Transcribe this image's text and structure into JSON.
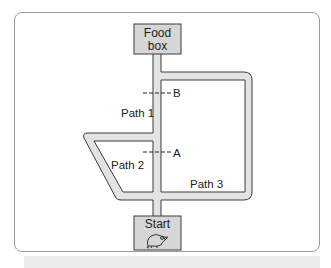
{
  "diagram": {
    "type": "rat maze with three paths",
    "boxes": {
      "food": {
        "line1": "Food",
        "line2": "box"
      },
      "start": {
        "label": "Start",
        "icon": "rat-icon"
      }
    },
    "paths": [
      {
        "id": "path-1",
        "label": "Path 1"
      },
      {
        "id": "path-2",
        "label": "Path 2"
      },
      {
        "id": "path-3",
        "label": "Path 3"
      }
    ],
    "blocks": [
      {
        "id": "block-b",
        "label": "B"
      },
      {
        "id": "block-a",
        "label": "A"
      }
    ]
  },
  "colors": {
    "road_fill": "#e3e3e3",
    "road_edge": "#3a3a3a",
    "box_fill": "#d6d6d6",
    "frame_border": "#9a9a9a"
  }
}
